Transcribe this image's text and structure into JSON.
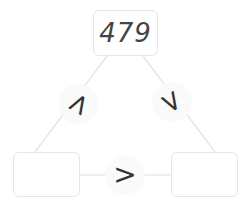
{
  "puzzle": {
    "top_value": "479",
    "bottom_left_value": "",
    "bottom_right_value": "",
    "left_symbol": ">",
    "right_symbol": ">",
    "bottom_symbol": ">"
  },
  "colors": {
    "box_border": "#e6e6e6",
    "edge_line": "#e8e8e8",
    "symbol": "#333333",
    "circle_bg": "#fafafa"
  }
}
